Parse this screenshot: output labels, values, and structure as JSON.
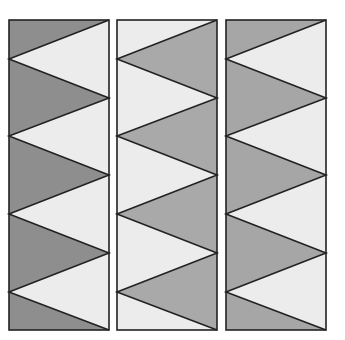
{
  "figure": {
    "zigzag": {
      "top_y": 20,
      "bottom_y": 330,
      "left_vertices_y": [
        59,
        136,
        214,
        292
      ],
      "right_vertices_y": [
        20,
        98,
        175,
        253,
        330
      ]
    },
    "panels": [
      {
        "id": "panel-1",
        "x": 9,
        "width": 100,
        "left_region_color": "#8e8e8e",
        "right_triangle_color": "#ececec",
        "stroke_color": "#222222"
      },
      {
        "id": "panel-2",
        "x": 117,
        "width": 100,
        "left_region_color": "#ececec",
        "right_triangle_color": "#a9a9a9",
        "stroke_color": "#222222"
      },
      {
        "id": "panel-3",
        "x": 226,
        "width": 100,
        "left_region_color": "#a6a6a6",
        "right_triangle_color": "#ececec",
        "stroke_color": "#222222"
      }
    ]
  }
}
